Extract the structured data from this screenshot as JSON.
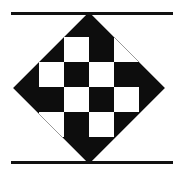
{
  "figure": {
    "title": "Checkerboard Diamond Pattern",
    "type": "geometric-pattern",
    "canvas": {
      "width": 173,
      "height": 176,
      "background_color": "#ffffff"
    },
    "colors": {
      "black": "#0d0d0d",
      "white": "#ffffff",
      "outline_gray": "#9a9a9a",
      "bar_black": "#111111"
    },
    "diamond": {
      "name": "rotated-square-diamond",
      "center_x": 89,
      "center_y": 88,
      "half_diagonal": 76,
      "vertices": [
        {
          "label": "top",
          "x": 89,
          "y": 12
        },
        {
          "label": "right",
          "x": 165,
          "y": 88
        },
        {
          "label": "bottom",
          "x": 89,
          "y": 164
        },
        {
          "label": "left",
          "x": 13,
          "y": 88
        }
      ],
      "fill_color": "#0d0d0d",
      "stroke_color": "#9a9a9a",
      "stroke_width": 1
    },
    "checkerboard": {
      "name": "4x4-checkerboard",
      "rows": 4,
      "columns": 4,
      "cell_size": 25,
      "origin_x": 39,
      "origin_y": 37,
      "grid_lines_x": [
        39,
        64,
        89,
        114,
        139
      ],
      "grid_lines_y": [
        37,
        62,
        87,
        112,
        137
      ],
      "pattern": [
        [
          "black",
          "white",
          "black",
          "white"
        ],
        [
          "white",
          "black",
          "white",
          "black"
        ],
        [
          "black",
          "white",
          "black",
          "white"
        ],
        [
          "white",
          "black",
          "white",
          "black"
        ]
      ]
    },
    "bars": [
      {
        "label": "top-rule",
        "x": 11,
        "y": 12,
        "width": 162,
        "height": 3,
        "color": "#111111"
      },
      {
        "label": "bottom-rule",
        "x": 11,
        "y": 161,
        "width": 162,
        "height": 3,
        "color": "#111111"
      }
    ]
  }
}
